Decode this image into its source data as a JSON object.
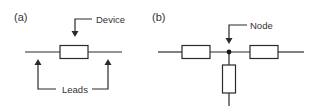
{
  "diagram": {
    "panel_a": {
      "label": "(a)",
      "device_label": "Device",
      "leads_label": "Leads"
    },
    "panel_b": {
      "label": "(b)",
      "node_label": "Node"
    },
    "colors": {
      "stroke": "#2a2a2a",
      "text": "#333333",
      "background": "#ffffff"
    }
  }
}
